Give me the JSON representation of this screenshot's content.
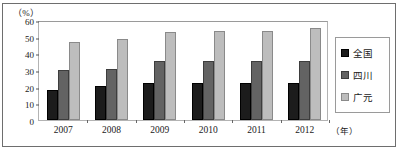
{
  "chart_data": {
    "type": "bar",
    "title": "",
    "xlabel": "年",
    "ylabel": "%",
    "ylim": [
      0,
      60
    ],
    "yticks": [
      0,
      10,
      20,
      30,
      40,
      50,
      60
    ],
    "categories": [
      "2007",
      "2008",
      "2009",
      "2010",
      "2011",
      "2012"
    ],
    "grid": false,
    "legend_position": "right",
    "series": [
      {
        "name": "全国",
        "color": "#1c1c1c",
        "values": [
          18,
          20.5,
          22,
          22,
          22,
          22.5
        ]
      },
      {
        "name": "四川",
        "color": "#636363",
        "values": [
          30,
          30.5,
          35.5,
          35.5,
          35.5,
          35.5
        ]
      },
      {
        "name": "广元",
        "color": "#bdbdbd",
        "values": [
          47,
          48.5,
          53,
          53.5,
          53.5,
          55
        ]
      }
    ]
  },
  "axis": {
    "y_unit_label": "（%）",
    "x_unit_label": "（年）"
  }
}
